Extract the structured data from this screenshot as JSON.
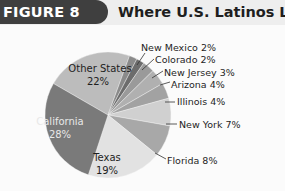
{
  "header": {
    "figure_label": "FIGURE 8",
    "title": "Where U.S. Latinos Live"
  },
  "colors": {
    "badge": "#3f3f3f",
    "header_bg": "#eeeeee"
  },
  "chart_data": {
    "type": "pie",
    "title": "Where U.S. Latinos Live",
    "unit": "%",
    "slices": [
      {
        "label": "Other States",
        "value": 22,
        "display": "22%",
        "color": "#bcbcbc"
      },
      {
        "label": "New Mexico",
        "value": 2,
        "display": "2%",
        "color": "#8a8a8a"
      },
      {
        "label": "Colorado",
        "value": 2,
        "display": "2%",
        "color": "#6c6c6c"
      },
      {
        "label": "New Jersey",
        "value": 3,
        "display": "3%",
        "color": "#9a9a9a"
      },
      {
        "label": "Arizona",
        "value": 4,
        "display": "4%",
        "color": "#b0b0b0"
      },
      {
        "label": "Illinois",
        "value": 4,
        "display": "4%",
        "color": "#a2a2a2"
      },
      {
        "label": "New York",
        "value": 7,
        "display": "7%",
        "color": "#d0d0d0"
      },
      {
        "label": "Florida",
        "value": 8,
        "display": "8%",
        "color": "#a8a8a8"
      },
      {
        "label": "Texas",
        "value": 19,
        "display": "19%",
        "color": "#e2e2e2"
      },
      {
        "label": "California",
        "value": 28,
        "display": "28%",
        "color": "#7a7a7a"
      }
    ],
    "labels": {
      "other_states": "Other States",
      "other_states_pct": "22%",
      "california": "California",
      "california_pct": "28%",
      "texas": "Texas",
      "texas_pct": "19%",
      "new_mexico": "New Mexico 2%",
      "colorado": "Colorado 2%",
      "new_jersey": "New Jersey 3%",
      "arizona": "Arizona 4%",
      "illinois": "Illinois 4%",
      "new_york": "New York 7%",
      "florida": "Florida 8%"
    }
  }
}
